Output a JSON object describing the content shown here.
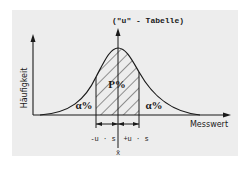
{
  "diagram": {
    "title": "(\"u\" - Tabelle)",
    "y_axis_label": "Häufigkeit",
    "x_axis_label": "Messwert",
    "center_label": "P%",
    "left_tail_label": "α%",
    "right_tail_label": "α%",
    "left_bound_label": "-u · s",
    "right_bound_label": "+u · s",
    "mean_label": "x̄",
    "colors": {
      "background": "#ededed",
      "ink": "#1a1a1a"
    }
  }
}
